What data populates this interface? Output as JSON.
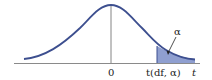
{
  "diagram": {
    "type": "t-distribution-upper-tail",
    "labels": {
      "zero": "0",
      "critical_value": "t(df, α)",
      "axis_variable": "t",
      "tail_area": "α"
    },
    "colors": {
      "curve": "#3d4f8f",
      "shade": "#8f9fd0",
      "axis": "#8a8a8a",
      "center_line": "#555555"
    }
  }
}
